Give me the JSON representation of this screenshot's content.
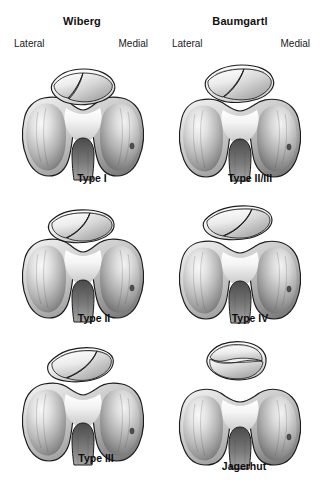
{
  "figure": {
    "background_color": "#ffffff"
  },
  "columns": [
    {
      "id": "wiberg",
      "title": "Wiberg",
      "center_x": 82
    },
    {
      "id": "baumgartl",
      "title": "Baumgartl",
      "center_x": 240
    }
  ],
  "orientation_labels": [
    {
      "text": "Lateral",
      "x": 14,
      "y": 38,
      "align": "left",
      "column": "wiberg"
    },
    {
      "text": "Medial",
      "x": 148,
      "y": 38,
      "align": "right",
      "column": "wiberg"
    },
    {
      "text": "Medial",
      "x": 310,
      "y": 38,
      "align": "right",
      "column": "baumgartl"
    },
    {
      "text": "Lateral",
      "x": 172,
      "y": 38,
      "align": "left",
      "column": "baumgartl"
    }
  ],
  "panels": [
    {
      "id": "wiberg-type-1",
      "column": "wiberg",
      "label": "Type I",
      "label_x": 92,
      "label_y": 172,
      "x": 8,
      "y": 50,
      "patella": {
        "shape": "near-symmetric",
        "ridge_offset": 0.04,
        "detached": false,
        "tilt": -3,
        "width": 74,
        "height": 30
      }
    },
    {
      "id": "baumgartl-type-2-3",
      "column": "baumgartl",
      "label": "Type II/III",
      "label_x": 250,
      "label_y": 172,
      "x": 166,
      "y": 50,
      "patella": {
        "shape": "lateral-facet-larger",
        "ridge_offset": 0.12,
        "detached": false,
        "tilt": -4,
        "width": 72,
        "height": 26
      }
    },
    {
      "id": "wiberg-type-2",
      "column": "wiberg",
      "label": "Type II",
      "label_x": 94,
      "label_y": 312,
      "x": 8,
      "y": 192,
      "patella": {
        "shape": "medial-facet-smaller",
        "ridge_offset": 0.16,
        "detached": false,
        "tilt": -6,
        "width": 68,
        "height": 24
      }
    },
    {
      "id": "baumgartl-type-4",
      "column": "baumgartl",
      "label": "Type IV",
      "label_x": 250,
      "label_y": 312,
      "x": 166,
      "y": 192,
      "patella": {
        "shape": "hemipatella-flat-medial",
        "ridge_offset": 0.26,
        "detached": false,
        "tilt": -7,
        "width": 66,
        "height": 22
      }
    },
    {
      "id": "wiberg-type-3",
      "column": "wiberg",
      "label": "Type III",
      "label_x": 96,
      "label_y": 452,
      "x": 8,
      "y": 332,
      "patella": {
        "shape": "small-medial-facet",
        "ridge_offset": 0.3,
        "detached": false,
        "tilt": -8,
        "width": 66,
        "height": 26
      }
    },
    {
      "id": "baumgartl-jagerhut",
      "column": "baumgartl",
      "label": "Jagerhut",
      "label_x": 244,
      "label_y": 460,
      "x": 166,
      "y": 332,
      "patella": {
        "shape": "hunters-cap-dome",
        "ridge_offset": 0.0,
        "detached": true,
        "tilt": 0,
        "width": 62,
        "height": 30
      }
    }
  ],
  "anatomy": {
    "structures": [
      "patella",
      "lateral femoral condyle",
      "medial femoral condyle",
      "trochlear groove",
      "intercondylar notch"
    ],
    "outline_color": "#1c1c1c",
    "fill_light": "#f2f2f2",
    "fill_mid": "#b9b9b9",
    "fill_dark": "#6d6d6d"
  }
}
